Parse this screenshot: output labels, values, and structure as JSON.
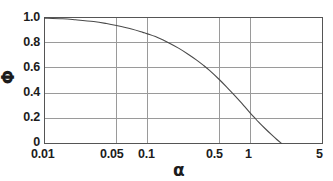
{
  "chart_data": {
    "type": "line",
    "title": "",
    "xlabel": "α",
    "ylabel": "Φ",
    "xscale": "log",
    "yscale": "linear",
    "xlim": [
      0.01,
      5
    ],
    "ylim": [
      0,
      1.0
    ],
    "grid": true,
    "legend": null,
    "xticks": [
      0.01,
      0.05,
      0.1,
      0.5,
      1,
      5
    ],
    "xtick_labels": [
      "0.01",
      "0.05",
      "0.1",
      "0.5",
      "1",
      "5"
    ],
    "yticks": [
      0,
      0.2,
      0.4,
      0.6,
      0.8,
      1.0
    ],
    "ytick_labels": [
      "0",
      "0.2",
      "0.4",
      "0.6",
      "0.8",
      "1.0"
    ],
    "series": [
      {
        "name": "Φ(α)",
        "color": "#4a4a4a",
        "x": [
          0.01,
          0.015,
          0.02,
          0.03,
          0.04,
          0.05,
          0.07,
          0.09,
          0.1,
          0.13,
          0.16,
          0.2,
          0.25,
          0.3,
          0.35,
          0.4,
          0.5,
          0.6,
          0.7,
          0.8,
          0.9,
          1.0,
          1.1,
          1.2,
          1.4,
          1.6,
          1.8,
          2.0
        ],
        "y": [
          0.995,
          0.99,
          0.982,
          0.968,
          0.952,
          0.936,
          0.908,
          0.882,
          0.87,
          0.836,
          0.8,
          0.757,
          0.707,
          0.662,
          0.62,
          0.58,
          0.506,
          0.44,
          0.382,
          0.33,
          0.282,
          0.24,
          0.203,
          0.17,
          0.115,
          0.07,
          0.032,
          0.0
        ]
      }
    ]
  },
  "axes": {
    "x_title": "α",
    "y_title": "Φ"
  },
  "colors": {
    "curve": "#4a4a4a",
    "grid": "#9a9a9a",
    "axis": "#555555",
    "text": "#1c1c1c",
    "background": "#ffffff"
  }
}
